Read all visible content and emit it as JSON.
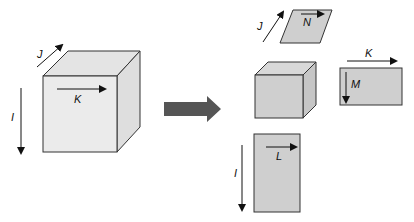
{
  "diagram": {
    "colors": {
      "big_cube_front": "#ebebeb",
      "big_cube_top": "#e4e4e4",
      "big_cube_side": "#dedede",
      "small_face": "#cfcfcf",
      "small_top": "#d8d8d8",
      "small_side": "#c6c6c6",
      "outline": "#333333",
      "big_arrow": "#555555"
    },
    "source_cube": {
      "labels": {
        "i": "I",
        "j": "J",
        "k": "K"
      }
    },
    "transform_arrow": {
      "direction": "right"
    },
    "result": {
      "small_cube": {
        "label": ""
      },
      "slice_jn": {
        "axis_label": "J",
        "inner_label": "N"
      },
      "slice_km": {
        "axis_label": "K",
        "inner_label": "M"
      },
      "slice_il": {
        "axis_label": "I",
        "inner_label": "L"
      }
    }
  }
}
